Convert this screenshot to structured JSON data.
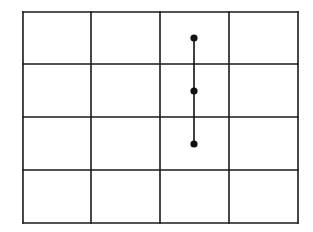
{
  "diagram": {
    "type": "grid-with-vertical-segment",
    "grid": {
      "columns": 4,
      "rows": 4,
      "x_lines": [
        23,
        91,
        160,
        229,
        298
      ],
      "y_lines": [
        12,
        64,
        117,
        170,
        223
      ],
      "line_color": "#1a1a1a",
      "line_width": 1.6
    },
    "segment": {
      "x": 194,
      "y_start": 38,
      "y_end": 144,
      "color": "#111111",
      "width": 1.6
    },
    "points": [
      {
        "x": 194,
        "y": 38
      },
      {
        "x": 194,
        "y": 91
      },
      {
        "x": 194,
        "y": 144
      }
    ],
    "point_radius": 3.6,
    "point_color": "#111111"
  }
}
